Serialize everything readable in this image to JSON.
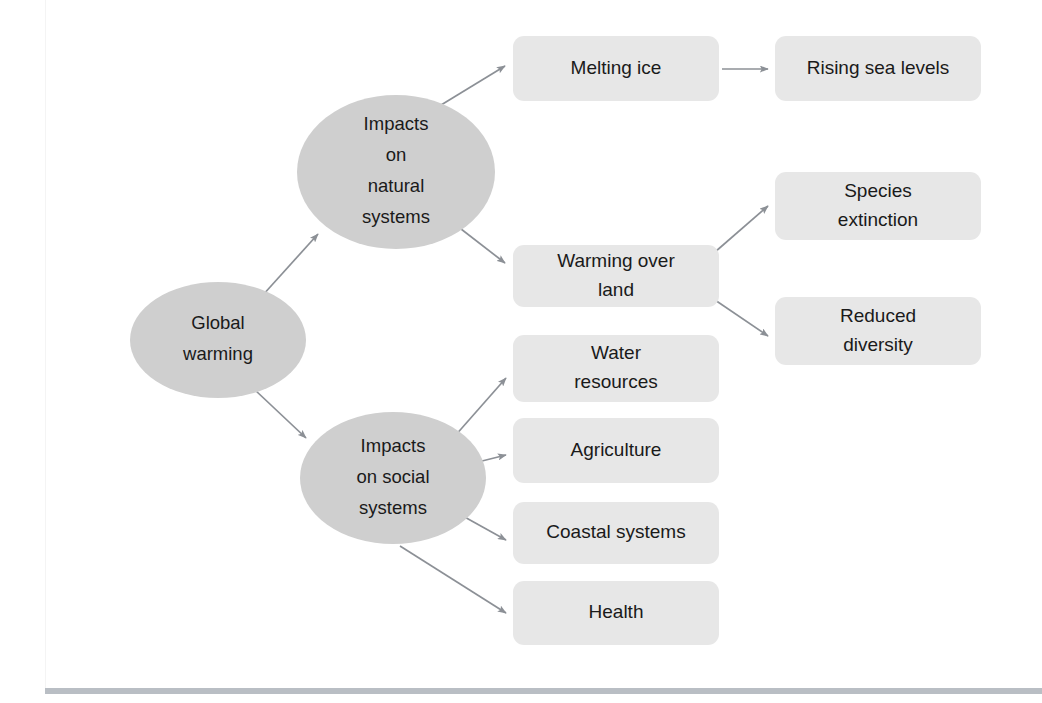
{
  "diagram": {
    "colors": {
      "ellipse_fill": "#cfcfcf",
      "box_fill": "#e7e7e7",
      "arrow": "#8c9096",
      "text": "#1a1a1a",
      "rule": "#b9bec4",
      "background": "#ffffff"
    },
    "nodes": [
      {
        "id": "global-warming",
        "shape": "ellipse",
        "lines": [
          "Global",
          "warming"
        ],
        "cx": 218,
        "cy": 340,
        "rx": 88,
        "ry": 58
      },
      {
        "id": "impacts-natural-systems",
        "shape": "ellipse",
        "lines": [
          "Impacts",
          "on",
          "natural",
          "systems"
        ],
        "cx": 396,
        "cy": 172,
        "rx": 99,
        "ry": 77
      },
      {
        "id": "impacts-social-systems",
        "shape": "ellipse",
        "lines": [
          "Impacts",
          "on social",
          "systems"
        ],
        "cx": 393,
        "cy": 478,
        "rx": 93,
        "ry": 66
      },
      {
        "id": "melting-ice",
        "shape": "box",
        "lines": [
          "Melting ice"
        ],
        "x": 513,
        "y": 36,
        "w": 206,
        "h": 65
      },
      {
        "id": "rising-sea-levels",
        "shape": "box",
        "lines": [
          "Rising sea levels"
        ],
        "x": 775,
        "y": 36,
        "w": 206,
        "h": 65
      },
      {
        "id": "warming-over-land",
        "shape": "box",
        "lines": [
          "Warming over",
          "land"
        ],
        "x": 513,
        "y": 245,
        "w": 206,
        "h": 62
      },
      {
        "id": "species-extinction",
        "shape": "box",
        "lines": [
          "Species",
          "extinction"
        ],
        "x": 775,
        "y": 172,
        "w": 206,
        "h": 68
      },
      {
        "id": "reduced-diversity",
        "shape": "box",
        "lines": [
          "Reduced",
          "diversity"
        ],
        "x": 775,
        "y": 297,
        "w": 206,
        "h": 68
      },
      {
        "id": "water-resources",
        "shape": "box",
        "lines": [
          "Water",
          "resources"
        ],
        "x": 513,
        "y": 335,
        "w": 206,
        "h": 67
      },
      {
        "id": "agriculture",
        "shape": "box",
        "lines": [
          "Agriculture"
        ],
        "x": 513,
        "y": 418,
        "w": 206,
        "h": 65
      },
      {
        "id": "coastal-systems",
        "shape": "box",
        "lines": [
          "Coastal systems"
        ],
        "x": 513,
        "y": 502,
        "w": 206,
        "h": 62
      },
      {
        "id": "health",
        "shape": "box",
        "lines": [
          "Health"
        ],
        "x": 513,
        "y": 581,
        "w": 206,
        "h": 64
      }
    ],
    "edges": [
      {
        "id": "global-to-natural",
        "from": "global-warming",
        "to": "impacts-natural-systems"
      },
      {
        "id": "global-to-social",
        "from": "global-warming",
        "to": "impacts-social-systems"
      },
      {
        "id": "natural-to-melting-ice",
        "from": "impacts-natural-systems",
        "to": "melting-ice"
      },
      {
        "id": "natural-to-warming-over-land",
        "from": "impacts-natural-systems",
        "to": "warming-over-land"
      },
      {
        "id": "melting-ice-to-rising-sea-levels",
        "from": "melting-ice",
        "to": "rising-sea-levels"
      },
      {
        "id": "warming-over-land-to-species-extinction",
        "from": "warming-over-land",
        "to": "species-extinction"
      },
      {
        "id": "warming-over-land-to-reduced-diversity",
        "from": "warming-over-land",
        "to": "reduced-diversity"
      },
      {
        "id": "social-to-water-resources",
        "from": "impacts-social-systems",
        "to": "water-resources"
      },
      {
        "id": "social-to-agriculture",
        "from": "impacts-social-systems",
        "to": "agriculture"
      },
      {
        "id": "social-to-coastal-systems",
        "from": "impacts-social-systems",
        "to": "coastal-systems"
      },
      {
        "id": "social-to-health",
        "from": "impacts-social-systems",
        "to": "health"
      }
    ]
  }
}
